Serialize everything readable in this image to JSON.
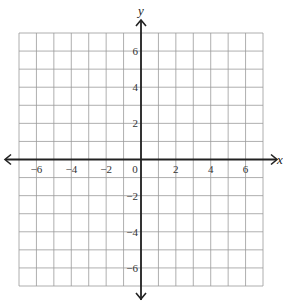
{
  "graph": {
    "x_axis_label": "x",
    "y_axis_label": "y",
    "x_range": [
      -7,
      7
    ],
    "y_range": [
      -7,
      7
    ],
    "grid_step": 1,
    "label_step": 2,
    "x_tick_labels": [
      "−6",
      "−4",
      "−2",
      "0",
      "2",
      "4",
      "6"
    ],
    "x_tick_values": [
      -6,
      -4,
      -2,
      0,
      2,
      4,
      6
    ],
    "y_tick_labels": [
      "6",
      "4",
      "2",
      "−2",
      "−4",
      "−6"
    ],
    "y_tick_values": [
      6,
      4,
      2,
      -2,
      -4,
      -6
    ],
    "colors": {
      "grid": "#9a9a9a",
      "axis": "#222222",
      "label": "#333333",
      "background": "#ffffff"
    }
  }
}
